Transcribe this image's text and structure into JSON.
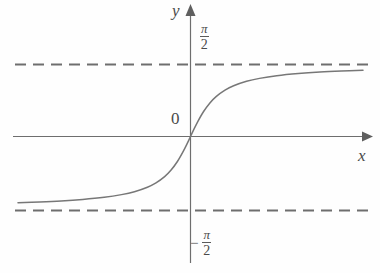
{
  "figure": {
    "background_color": "#fefefe",
    "ink_color": "#6e6e6e",
    "label_color": "#4a4a4a"
  },
  "labels": {
    "y_axis": "y",
    "x_axis": "x",
    "origin": "0",
    "pi_numerator": "π",
    "two_denominator": "2",
    "minus_sign": "−"
  },
  "chart_data": {
    "type": "line",
    "title": "",
    "subtitle": "",
    "xlabel": "x",
    "ylabel": "y",
    "function": "y = arctan(x)",
    "grid": false,
    "legend": null,
    "xlim": [
      -8,
      8
    ],
    "ylim": [
      -2.2,
      2.2
    ],
    "tick_labels": {
      "y": [
        "π/2",
        "−π/2"
      ]
    },
    "annotations": [
      {
        "text": "π/2",
        "x": 0.35,
        "y": 1.83,
        "role": "upper-asymptote-label"
      },
      {
        "text": "−π/2",
        "x": 0.1,
        "y": -1.95,
        "role": "lower-asymptote-label"
      },
      {
        "text": "0",
        "x": -0.45,
        "y": 0.42,
        "role": "origin-label"
      }
    ],
    "asymptotes": [
      {
        "type": "horizontal",
        "value": 1.5708,
        "label": "π/2",
        "style": "dashed"
      },
      {
        "type": "horizontal",
        "value": -1.5708,
        "label": "−π/2",
        "style": "dashed"
      }
    ],
    "series": [
      {
        "name": "arctan(x)",
        "style": "solid",
        "x": [
          -8.0,
          -7.0,
          -6.0,
          -5.0,
          -4.0,
          -3.2,
          -2.6,
          -2.0,
          -1.6,
          -1.2,
          -0.9,
          -0.6,
          -0.35,
          -0.15,
          0.0,
          0.15,
          0.35,
          0.6,
          0.9,
          1.2,
          1.6,
          2.0,
          2.6,
          3.2,
          4.0,
          5.0,
          6.0,
          7.0,
          8.0
        ],
        "values": [
          -1.446,
          -1.429,
          -1.406,
          -1.373,
          -1.326,
          -1.268,
          -1.205,
          -1.107,
          -1.012,
          -0.876,
          -0.733,
          -0.54,
          -0.336,
          -0.149,
          0.0,
          0.149,
          0.336,
          0.54,
          0.733,
          0.876,
          1.012,
          1.107,
          1.205,
          1.268,
          1.326,
          1.373,
          1.406,
          1.429,
          1.446
        ]
      }
    ]
  }
}
